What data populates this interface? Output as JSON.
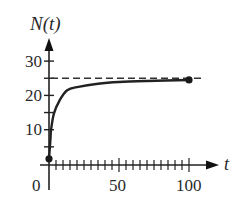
{
  "chart_data": {
    "type": "line",
    "title": "",
    "ylabel": "N(t)",
    "xlabel": "t",
    "xlim": [
      0,
      100
    ],
    "ylim": [
      0,
      30
    ],
    "x_tick_labels": [
      "0",
      "50",
      "100"
    ],
    "x_major_ticks": [
      0,
      50,
      100
    ],
    "x_minor_tick_step": 5,
    "y_tick_labels": [
      "10",
      "20",
      "30"
    ],
    "y_major_ticks": [
      10,
      20,
      30
    ],
    "y_minor_ticks": [
      5,
      15,
      25
    ],
    "grid": false,
    "legend": null,
    "asymptote": {
      "y": 25,
      "style": "dashed",
      "label": ""
    },
    "series": [
      {
        "name": "N(t)",
        "x": [
          0,
          1,
          1.5,
          3.5,
          7.5,
          13,
          21,
          35,
          50,
          70,
          100
        ],
        "y": [
          1.5,
          7,
          10,
          14.7,
          18.5,
          21.5,
          22.5,
          23.4,
          23.9,
          24.2,
          24.5
        ],
        "endpoints": [
          {
            "t": 0,
            "N": 1.5,
            "marker": "filled-dot"
          },
          {
            "t": 100,
            "N": 24.5,
            "marker": "filled-dot"
          }
        ]
      }
    ]
  },
  "labels": {
    "y_axis": "N(t)",
    "x_axis": "t",
    "origin": "0",
    "x50": "50",
    "x100": "100",
    "y10": "10",
    "y20": "20",
    "y30": "30"
  }
}
